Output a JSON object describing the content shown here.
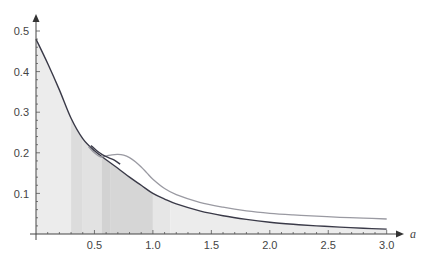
{
  "chart_data": {
    "type": "area",
    "title": "",
    "xlabel": "a",
    "ylabel": "",
    "xlim": [
      0,
      3.0
    ],
    "ylim": [
      0,
      0.52
    ],
    "grid": false,
    "legend": null,
    "x_ticks": [
      0.5,
      1.0,
      1.5,
      2.0,
      2.5,
      3.0
    ],
    "x_tick_labels": [
      "0.5",
      "1.0",
      "1.5",
      "2.0",
      "2.5",
      "3.0"
    ],
    "y_ticks": [
      0.1,
      0.2,
      0.3,
      0.4,
      0.5
    ],
    "y_tick_labels": [
      "0.1",
      "0.2",
      "0.3",
      "0.4",
      "0.5"
    ],
    "series": [
      {
        "name": "lower-dark-curve",
        "color": "#3a3a48",
        "filled": true,
        "x": [
          0.0,
          0.1,
          0.2,
          0.3,
          0.4,
          0.5,
          0.6,
          0.7,
          0.8,
          0.9,
          1.0,
          1.1,
          1.2,
          1.4,
          1.6,
          1.8,
          2.0,
          2.2,
          2.4,
          2.6,
          2.8,
          3.0
        ],
        "values": [
          0.48,
          0.42,
          0.355,
          0.285,
          0.235,
          0.205,
          0.183,
          0.162,
          0.14,
          0.12,
          0.1,
          0.086,
          0.074,
          0.057,
          0.045,
          0.036,
          0.029,
          0.024,
          0.02,
          0.017,
          0.014,
          0.012
        ]
      },
      {
        "name": "upper-light-curve",
        "color": "#9a9aa2",
        "filled": false,
        "x": [
          0.45,
          0.5,
          0.55,
          0.6,
          0.65,
          0.7,
          0.75,
          0.8,
          0.85,
          0.9,
          0.95,
          1.0,
          1.1,
          1.2,
          1.4,
          1.6,
          1.8,
          2.0,
          2.2,
          2.4,
          2.6,
          2.8,
          3.0
        ],
        "values": [
          0.215,
          0.2,
          0.19,
          0.192,
          0.195,
          0.196,
          0.194,
          0.188,
          0.178,
          0.165,
          0.15,
          0.135,
          0.112,
          0.097,
          0.078,
          0.066,
          0.057,
          0.051,
          0.047,
          0.044,
          0.041,
          0.039,
          0.037
        ]
      },
      {
        "name": "short-dark-segment",
        "color": "#3a3a48",
        "filled": false,
        "x": [
          0.47,
          0.52,
          0.57,
          0.62,
          0.67,
          0.72
        ],
        "values": [
          0.218,
          0.205,
          0.195,
          0.188,
          0.182,
          0.172
        ]
      }
    ],
    "shaded_bands": [
      {
        "x0": 0.0,
        "x1": 0.3,
        "shade": "#ececec"
      },
      {
        "x0": 0.3,
        "x1": 0.4,
        "shade": "#dcdcdc"
      },
      {
        "x0": 0.4,
        "x1": 0.56,
        "shade": "#e2e2e2"
      },
      {
        "x0": 0.56,
        "x1": 0.64,
        "shade": "#d2d2d2"
      },
      {
        "x0": 0.64,
        "x1": 1.0,
        "shade": "#d6d6d6"
      },
      {
        "x0": 1.0,
        "x1": 1.15,
        "shade": "#e6e6e6"
      },
      {
        "x0": 1.15,
        "x1": 3.0,
        "shade": "#ececec"
      }
    ]
  },
  "axes": {
    "x_label": "a",
    "x_tick_labels": [
      "0.5",
      "1.0",
      "1.5",
      "2.0",
      "2.5",
      "3.0"
    ],
    "y_tick_labels": [
      "0.1",
      "0.2",
      "0.3",
      "0.4",
      "0.5"
    ]
  }
}
